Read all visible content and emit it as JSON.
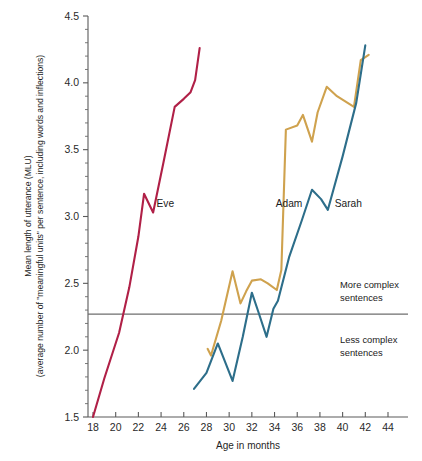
{
  "chart_data": {
    "type": "line",
    "title": "",
    "xlabel": "Age in months",
    "ylabel": "Mean length of utterance (MLU)",
    "ylabel_sub": "(average number of \"meaningful units\" per sentence, including words and inflections)",
    "xlim": [
      17,
      45
    ],
    "ylim": [
      1.5,
      4.5
    ],
    "x_ticks": [
      18,
      20,
      22,
      24,
      26,
      28,
      30,
      32,
      34,
      36,
      38,
      40,
      42,
      44
    ],
    "x_tick_labels": [
      "18",
      "20",
      "22",
      "24",
      "26",
      "28",
      "30",
      "32",
      "34",
      "36",
      "38",
      "40",
      "42",
      "44"
    ],
    "y_ticks": [
      1.5,
      2.0,
      2.5,
      3.0,
      3.5,
      4.0,
      4.5
    ],
    "y_tick_labels": [
      "1.5",
      "2.0",
      "2.5",
      "3.0",
      "3.5",
      "4.0",
      "4.5"
    ],
    "y_minor_step": 0.1,
    "grid": false,
    "legend_position": "inline-labels",
    "threshold": {
      "value": 2.27,
      "above_label": "More complex sentences",
      "below_label": "Less complex sentences",
      "color": "#6e6e6e"
    },
    "series": [
      {
        "name": "Eve",
        "color": "#b02047",
        "label": "Eve",
        "label_x": 23.6,
        "label_y": 3.07,
        "x": [
          18.0,
          19.0,
          20.3,
          21.2,
          22.0,
          22.5,
          23.3,
          24.2,
          25.2,
          26.0,
          26.6,
          27.0,
          27.4
        ],
        "y": [
          1.5,
          1.79,
          2.13,
          2.47,
          2.85,
          3.17,
          3.03,
          3.4,
          3.82,
          3.88,
          3.93,
          4.02,
          4.26
        ]
      },
      {
        "name": "Adam",
        "color": "#cfa24e",
        "label": "Adam",
        "label_x": 34.1,
        "label_y": 3.07,
        "x": [
          28.1,
          28.4,
          29.3,
          30.3,
          31.0,
          31.5,
          32.0,
          32.8,
          33.4,
          34.2,
          34.6,
          35.0,
          36.0,
          36.5,
          37.3,
          37.8,
          38.6,
          39.5,
          41.0,
          41.6,
          42.3
        ],
        "y": [
          2.01,
          1.96,
          2.22,
          2.59,
          2.35,
          2.44,
          2.52,
          2.53,
          2.5,
          2.45,
          2.6,
          3.65,
          3.68,
          3.76,
          3.56,
          3.78,
          3.97,
          3.9,
          3.82,
          4.17,
          4.21
        ]
      },
      {
        "name": "Sarah",
        "color": "#2d6e8a",
        "label": "Sarah",
        "label_x": 39.3,
        "label_y": 3.07,
        "x": [
          26.9,
          28.0,
          29.0,
          30.3,
          31.2,
          32.0,
          32.6,
          33.3,
          33.9,
          34.3,
          35.3,
          36.4,
          37.3,
          38.1,
          38.7,
          40.0,
          41.2,
          42.0
        ],
        "y": [
          1.71,
          1.83,
          2.05,
          1.77,
          2.1,
          2.43,
          2.28,
          2.1,
          2.31,
          2.37,
          2.7,
          2.97,
          3.2,
          3.13,
          3.05,
          3.45,
          3.85,
          4.28
        ]
      }
    ]
  },
  "axis": {
    "x_title": "Age in months",
    "y_title_line1": "Mean length of utterance (MLU)",
    "y_title_line2": "(average number of \"meaningful units\" per sentence, including words and inflections)"
  },
  "annotations": {
    "more_complex_line1": "More complex",
    "more_complex_line2": "sentences",
    "less_complex_line1": "Less complex",
    "less_complex_line2": "sentences"
  }
}
